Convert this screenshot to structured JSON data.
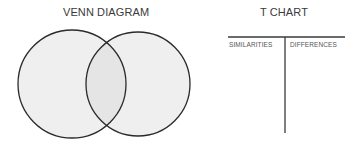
{
  "venn": {
    "title": "VENN DIAGRAM",
    "circles": [
      {
        "name": "left-circle",
        "cx": 72,
        "cy": 84,
        "r": 54
      },
      {
        "name": "right-circle",
        "cx": 138,
        "cy": 84,
        "r": 52
      }
    ],
    "fill_color": "#efefef",
    "overlap_color": "#e6e6e6",
    "stroke_color": "#2a2a2a"
  },
  "t_chart": {
    "title": "T CHART",
    "columns": [
      "SIMILARITIES",
      "DIFFERENCES"
    ],
    "line_color": "#3a3a3a"
  }
}
